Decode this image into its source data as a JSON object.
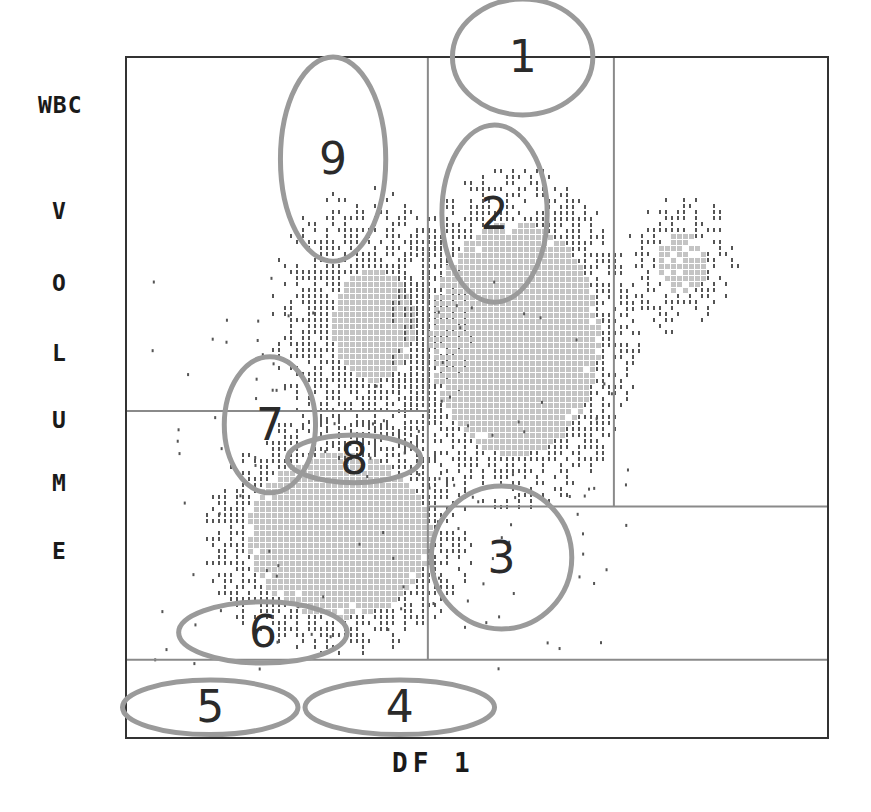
{
  "chart_data": {
    "type": "scatter",
    "title": "WBC",
    "xlabel": "DF 1",
    "ylabel": "VOLUME",
    "xlim": [
      0,
      100
    ],
    "ylim": [
      0,
      100
    ],
    "grid": false,
    "legend": "none",
    "gates": {
      "vertical": [
        {
          "x": 43,
          "y_from": 11.5,
          "y_to": 100
        },
        {
          "x": 69.5,
          "y_from": 34,
          "y_to": 100
        }
      ],
      "horizontal": [
        {
          "y": 48,
          "x_from": 0,
          "x_to": 43
        },
        {
          "y": 34,
          "x_from": 43,
          "x_to": 100
        },
        {
          "y": 11.5,
          "x_from": 0,
          "x_to": 100
        }
      ]
    },
    "clusters": [
      {
        "name": "lymphocytes",
        "cx": 30,
        "cy": 30,
        "rx": 13,
        "ry": 12,
        "density": "high"
      },
      {
        "name": "monocytes",
        "cx": 35,
        "cy": 61,
        "rx": 10,
        "ry": 14,
        "density": "medium"
      },
      {
        "name": "neutrophils",
        "cx": 55,
        "cy": 59,
        "rx": 12,
        "ry": 17,
        "density": "high"
      },
      {
        "name": "eosinophils",
        "cx": 79,
        "cy": 70,
        "rx": 6,
        "ry": 8,
        "density": "low"
      }
    ],
    "annotations": [
      {
        "label": "1",
        "cx": 56.5,
        "cy": 100,
        "rx": 10,
        "ry": 8.5
      },
      {
        "label": "2",
        "cx": 52.5,
        "cy": 77,
        "rx": 7.5,
        "ry": 13
      },
      {
        "label": "3",
        "cx": 53.5,
        "cy": 26.5,
        "rx": 10,
        "ry": 10.5
      },
      {
        "label": "4",
        "cx": 39,
        "cy": 4.5,
        "rx": 13.5,
        "ry": 4
      },
      {
        "label": "5",
        "cx": 12,
        "cy": 4.5,
        "rx": 12.5,
        "ry": 4
      },
      {
        "label": "6",
        "cx": 19.5,
        "cy": 15.5,
        "rx": 12,
        "ry": 4.5
      },
      {
        "label": "7",
        "cx": 20.5,
        "cy": 46,
        "rx": 6.5,
        "ry": 10
      },
      {
        "label": "8",
        "cx": 32.5,
        "cy": 41,
        "rx": 9.5,
        "ry": 3.5
      },
      {
        "label": "9",
        "cx": 29.5,
        "cy": 85,
        "rx": 7.5,
        "ry": 15
      }
    ]
  },
  "labels": {
    "wbc": "WBC",
    "volume_letters": [
      "V",
      "O",
      "L",
      "U",
      "M",
      "E"
    ],
    "df1": "DF 1"
  },
  "colors": {
    "frame": "#333333",
    "gate": "#8a8a8a",
    "ellipse": "#9a9a9a",
    "dot_dark": "#555555",
    "dot_light": "#c4c4c4",
    "annotation_text": "#2a2a2a"
  }
}
